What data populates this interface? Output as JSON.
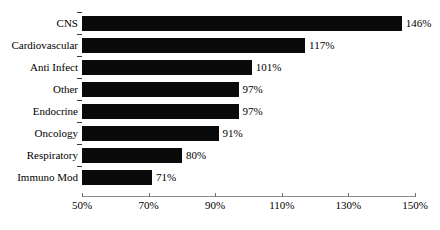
{
  "chart_data": {
    "type": "bar",
    "orientation": "horizontal",
    "title": "",
    "xlabel": "",
    "ylabel": "",
    "xlim": [
      50,
      150
    ],
    "xticks": [
      50,
      70,
      90,
      110,
      130,
      150
    ],
    "xtick_labels": [
      "50%",
      "70%",
      "90%",
      "110%",
      "130%",
      "150%"
    ],
    "grid": false,
    "legend": false,
    "bar_color": "#0a0a0a",
    "axis_color": "#8d8d8d",
    "background": "#ffffff",
    "categories": [
      "CNS",
      "Cardiovascular",
      "Anti Infect",
      "Other",
      "Endocrine",
      "Oncology",
      "Respiratory",
      "Immuno Mod"
    ],
    "values": [
      146,
      117,
      101,
      97,
      97,
      91,
      80,
      71
    ],
    "value_labels": [
      "146%",
      "117%",
      "101%",
      "97%",
      "97%",
      "91%",
      "80%",
      "71%"
    ]
  }
}
